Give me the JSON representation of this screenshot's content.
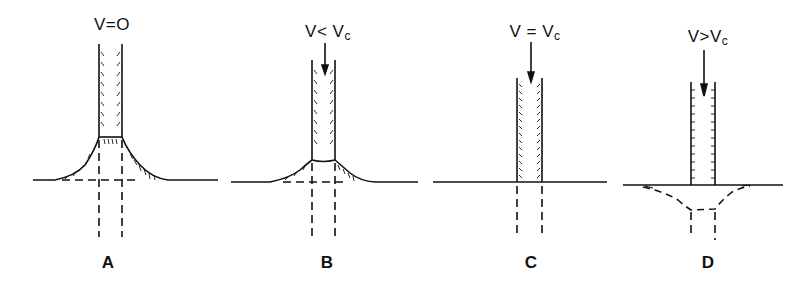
{
  "figure": {
    "panels": [
      {
        "id": "A",
        "label": "A",
        "condition": "V=O",
        "condition_main": "V=O",
        "condition_sub": "",
        "arrow": false,
        "profile": "raised-wide"
      },
      {
        "id": "B",
        "label": "B",
        "condition": "V< Vc",
        "condition_main": "V< V",
        "condition_sub": "c",
        "arrow": true,
        "profile": "raised-narrow"
      },
      {
        "id": "C",
        "label": "C",
        "condition": "V = Vc",
        "condition_main": "V = V",
        "condition_sub": "c",
        "arrow": true,
        "profile": "flat"
      },
      {
        "id": "D",
        "label": "D",
        "condition": "V>Vc",
        "condition_main": "V>V",
        "condition_sub": "c",
        "arrow": true,
        "profile": "depressed-dashed"
      }
    ]
  },
  "colors": {
    "ink": "#111111",
    "background": "#ffffff"
  }
}
